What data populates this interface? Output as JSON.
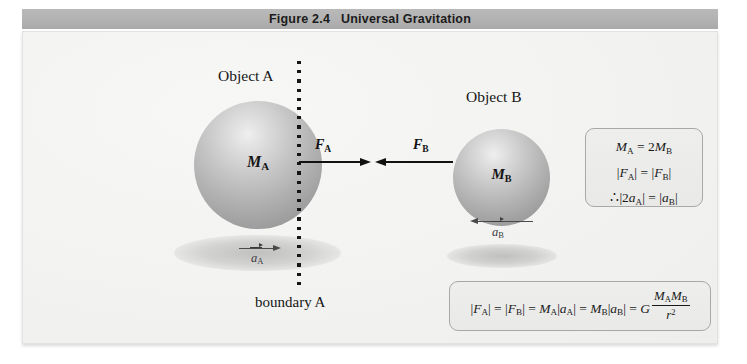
{
  "figure": {
    "title_number": "Figure 2.4",
    "title_text": "Universal Gravitation",
    "title_full": "Figure 2.4   Universal Gravitation"
  },
  "objects": {
    "a": {
      "label": "Object A",
      "mass_symbol": "M",
      "mass_subscript": "A",
      "force_symbol": "F",
      "force_subscript": "A",
      "accel_symbol": "a",
      "accel_subscript": "A",
      "force_direction": "right",
      "accel_direction": "right"
    },
    "b": {
      "label": "Object B",
      "mass_symbol": "M",
      "mass_subscript": "B",
      "force_symbol": "F",
      "force_subscript": "B",
      "accel_symbol": "a",
      "accel_subscript": "B",
      "force_direction": "left",
      "accel_direction": "left"
    }
  },
  "boundary": {
    "label": "boundary A",
    "style": "dotted-vertical"
  },
  "relations_box": {
    "line1": {
      "m": "M",
      "m_sub": "A",
      "eq": "=",
      "coef": "2",
      "m2": "M",
      "m2_sub": "B",
      "plain": "M_A = 2M_B"
    },
    "line2": {
      "f": "F",
      "f_sub": "A",
      "eq": "=",
      "f2": "F",
      "f2_sub": "B",
      "plain": "|F_A| = |F_B|"
    },
    "line3": {
      "therefore": "∴",
      "coef": "2",
      "a": "a",
      "a_sub": "A",
      "eq": "=",
      "a2": "a",
      "a2_sub": "B",
      "plain": "∴|2a_A| = |a_B|"
    }
  },
  "main_equation": {
    "plain": "|F_A| = |F_B| = M_A|a_A| = M_B|a_B| = G (M_A M_B)/r^2",
    "terms": {
      "f_a": "F",
      "f_a_sub": "A",
      "f_b": "F",
      "f_b_sub": "B",
      "m_a": "M",
      "m_a_sub": "A",
      "a_a": "a",
      "a_a_sub": "A",
      "m_b": "M",
      "m_b_sub": "B",
      "a_b": "a",
      "a_b_sub": "B",
      "g": "G",
      "num_m_a": "M",
      "num_m_a_sub": "A",
      "num_m_b": "M",
      "num_m_b_sub": "B",
      "den_r": "r",
      "den_exp": "2",
      "equals": "=",
      "bar": "|"
    }
  },
  "colors": {
    "title_bar": "#b2b2b2",
    "panel_background": "#f2f2f0",
    "sphere_light": "#efefef",
    "sphere_dark": "#8d8d8d",
    "arrow": "#111111",
    "accel_arrow": "#4a4a4a",
    "box_border": "#a8a8a8"
  }
}
